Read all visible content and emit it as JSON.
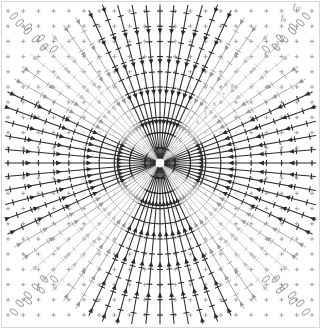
{
  "figure": {
    "type": "vector-field-diagram",
    "title": "",
    "background": "#ffffff",
    "border_color": "#d8d8d8",
    "width": 321,
    "height": 329
  },
  "plot": {
    "center": {
      "x": 160,
      "y": 163
    },
    "grid": {
      "spacing": 15.2,
      "marker": "plus",
      "marker_size": 4.2,
      "color": "#9b9b9b"
    },
    "rays": {
      "count": 72,
      "tick_marks": true,
      "arrowheads": "inward",
      "dark_color": "#2b2b2b",
      "light_color": "#c2c2c2"
    },
    "corner_markers": {
      "shape": "ellipse",
      "color": "#8d8d8d",
      "count_per_corner": 4
    }
  },
  "annotations": {
    "labels": [
      {
        "text": "f",
        "sub": "10",
        "x": 293,
        "y": 9
      },
      {
        "text": "f",
        "sub": "9",
        "x": 281,
        "y": 20
      }
    ],
    "diagonal_numbers": [
      {
        "text": "1",
        "x": 171,
        "y": 151
      },
      {
        "text": "2",
        "x": 179,
        "y": 142
      },
      {
        "text": "3",
        "x": 187,
        "y": 133
      },
      {
        "text": "4",
        "x": 196,
        "y": 124
      },
      {
        "text": "5",
        "x": 204,
        "y": 115
      },
      {
        "text": "6",
        "x": 213,
        "y": 106
      },
      {
        "text": "7",
        "x": 222,
        "y": 97
      },
      {
        "text": "8",
        "x": 231,
        "y": 88
      }
    ],
    "outer_numbers": [
      {
        "text": "8",
        "x": 264,
        "y": 56
      },
      {
        "text": "9",
        "x": 276,
        "y": 45
      }
    ]
  },
  "chart_data": {
    "type": "scatter",
    "xlabel": "",
    "ylabel": "",
    "legend": [],
    "grid": true,
    "xlim": [
      -10.5,
      10.5
    ],
    "ylim": [
      -10.5,
      10.5
    ],
    "center": [
      0,
      0
    ],
    "ray_angles_deg": [
      0,
      5,
      10,
      15,
      20,
      25,
      30,
      35,
      40,
      45,
      50,
      55,
      60,
      65,
      70,
      75,
      80,
      85,
      90,
      95,
      100,
      105,
      110,
      115,
      120,
      125,
      130,
      135,
      140,
      145,
      150,
      155,
      160,
      165,
      170,
      175,
      180,
      185,
      190,
      195,
      200,
      205,
      210,
      215,
      220,
      225,
      230,
      235,
      240,
      245,
      250,
      255,
      260,
      265,
      270,
      275,
      280,
      285,
      290,
      295,
      300,
      305,
      310,
      315,
      320,
      325,
      330,
      335,
      340,
      345,
      350,
      355
    ],
    "contour_levels": [
      1,
      2,
      3,
      4,
      5,
      6,
      7,
      8,
      9,
      10
    ],
    "series": [
      {
        "name": "f9",
        "values": [
          9
        ]
      },
      {
        "name": "f10",
        "values": [
          10
        ]
      }
    ]
  }
}
